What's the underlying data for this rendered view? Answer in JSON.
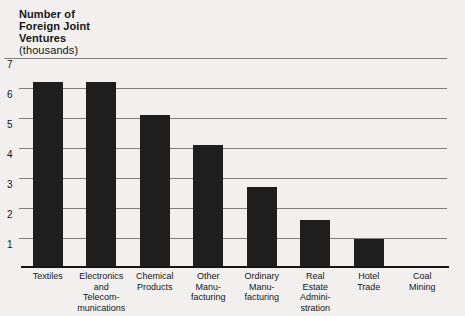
{
  "colors": {
    "background": "#f1f0ee",
    "bar": "#1e1e1e",
    "gridline": "#7f7f7f",
    "baseline": "#161616",
    "text": "#161616"
  },
  "chart_data": {
    "type": "bar",
    "title_lines": [
      "Number of",
      "Foreign Joint",
      "Ventures"
    ],
    "subtitle": "(thousands)",
    "title": "Number of Foreign Joint Ventures (thousands)",
    "xlabel": "",
    "ylabel": "Number of Foreign Joint Ventures (thousands)",
    "ylim": [
      0,
      7
    ],
    "yticks": [
      1,
      2,
      3,
      4,
      5,
      6,
      7
    ],
    "grid": true,
    "legend": "none",
    "categories": [
      "Textiles",
      "Electronics and Telecommunications",
      "Chemical Products",
      "Other Manufacturing",
      "Ordinary Manufacturing",
      "Real Estate Administration",
      "Hotel Trade",
      "Coal Mining"
    ],
    "category_label_lines": [
      [
        "Textiles"
      ],
      [
        "Electronics",
        "and",
        "Telecom-",
        "munications"
      ],
      [
        "Chemical",
        "Products"
      ],
      [
        "Other",
        "Manu-",
        "facturing"
      ],
      [
        "Ordinary",
        "Manu-",
        "facturing"
      ],
      [
        "Real",
        "Estate",
        "Admini-",
        "stration"
      ],
      [
        "Hotel",
        "Trade"
      ],
      [
        "Coal",
        "Mining"
      ]
    ],
    "values": [
      6.2,
      6.2,
      5.1,
      4.1,
      2.7,
      1.6,
      0.95,
      0.07
    ]
  }
}
